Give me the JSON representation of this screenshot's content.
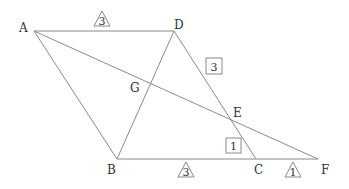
{
  "diagram": {
    "points": {
      "A": {
        "label": "A",
        "x": 34,
        "y": 31
      },
      "D": {
        "label": "D",
        "x": 174,
        "y": 31
      },
      "B": {
        "label": "B",
        "x": 117,
        "y": 159
      },
      "C": {
        "label": "C",
        "x": 256,
        "y": 159
      },
      "F": {
        "label": "F",
        "x": 318,
        "y": 159
      },
      "E": {
        "label": "E",
        "x": 232,
        "y": 119
      },
      "G": {
        "label": "G",
        "x": 147,
        "y": 86
      }
    },
    "segments": [
      "AD",
      "AB",
      "BF",
      "DC",
      "BD",
      "AF"
    ],
    "ratio_marks": {
      "AD_triangle": {
        "value": "3",
        "shape": "triangle"
      },
      "BC_triangle": {
        "value": "3",
        "shape": "triangle"
      },
      "CF_triangle": {
        "value": "1",
        "shape": "triangle"
      },
      "DE_box": {
        "value": "3",
        "shape": "box"
      },
      "EC_box": {
        "value": "1",
        "shape": "box"
      }
    }
  }
}
